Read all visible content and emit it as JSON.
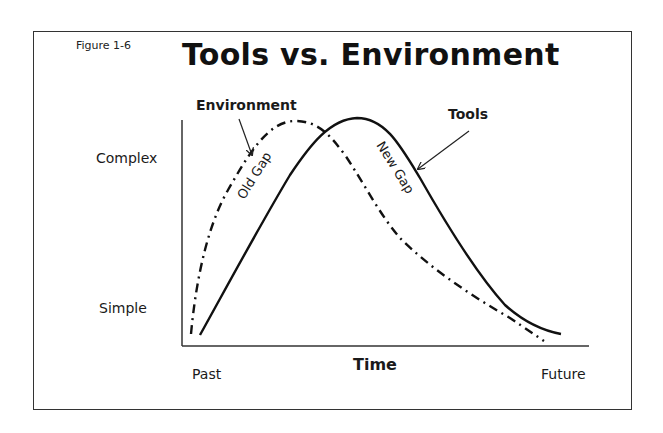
{
  "figure": {
    "label": "Figure 1-6",
    "title": "Tools vs. Environment"
  },
  "axes": {
    "y_high_label": "Complex",
    "y_low_label": "Simple",
    "x_start_label": "Past",
    "x_end_label": "Future",
    "x_title": "Time"
  },
  "series": {
    "environment": {
      "label": "Environment",
      "style": "dash-dot"
    },
    "tools": {
      "label": "Tools",
      "style": "solid"
    }
  },
  "annotations": {
    "old_gap": "Old Gap",
    "new_gap": "New Gap"
  },
  "colors": {
    "line": "#111111",
    "frame": "#333333",
    "background": "#ffffff"
  }
}
